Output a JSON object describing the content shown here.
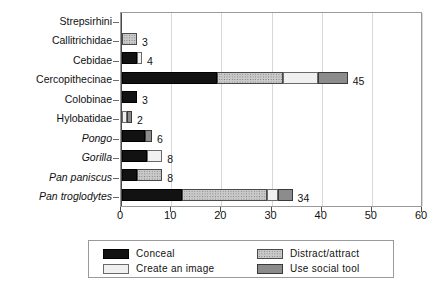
{
  "chart_data": {
    "type": "bar",
    "orientation": "horizontal",
    "stacked": true,
    "title": "",
    "xlabel": "",
    "ylabel": "",
    "xlim": [
      0,
      60
    ],
    "xticks": [
      0,
      10,
      20,
      30,
      40,
      50,
      60
    ],
    "xtick_labels": [
      "0",
      "10",
      "20",
      "30",
      "40",
      "50",
      "60"
    ],
    "grid": true,
    "legend_position": "bottom",
    "categories": [
      "Strepsirhini",
      "Callitrichidae",
      "Cebidae",
      "Cercopithecinae",
      "Colobinae",
      "Hylobatidae",
      "Pongo",
      "Gorilla",
      "Pan paniscus",
      "Pan troglodytes"
    ],
    "category_styles": [
      "normal",
      "normal",
      "normal",
      "normal",
      "normal",
      "normal",
      "italic",
      "italic",
      "italic",
      "italic"
    ],
    "series": [
      {
        "name": "Conceal",
        "color": "#121212",
        "values": [
          0,
          0,
          3,
          19,
          3,
          0,
          4.5,
          5,
          3,
          12
        ]
      },
      {
        "name": "Distract/attract",
        "color": "#c9c9c9",
        "values": [
          0,
          3,
          0,
          13,
          0,
          0,
          0,
          0,
          5,
          17
        ]
      },
      {
        "name": "Create an image",
        "color": "#f0f0f0",
        "values": [
          0,
          0,
          1,
          7,
          0,
          1,
          0,
          3,
          0,
          2
        ]
      },
      {
        "name": "Use social tool",
        "color": "#8c8c8c",
        "values": [
          0,
          0,
          0,
          6,
          0,
          1,
          1.5,
          0,
          0,
          3
        ]
      }
    ],
    "totals": [
      0,
      3,
      4,
      45,
      3,
      2,
      6,
      8,
      8,
      34
    ],
    "total_labels": [
      "",
      "3",
      "4",
      "45",
      "3",
      "2",
      "6",
      "8",
      "8",
      "34"
    ]
  },
  "legend": {
    "items": [
      {
        "label": "Conceal",
        "swatch": "conceal"
      },
      {
        "label": "Distract/attract",
        "swatch": "distract"
      },
      {
        "label": "Create an image",
        "swatch": "create"
      },
      {
        "label": "Use social tool",
        "swatch": "social"
      }
    ]
  },
  "caption": {
    "text": ""
  }
}
